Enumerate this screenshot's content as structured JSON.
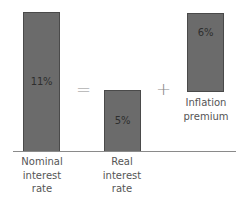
{
  "diagram": {
    "equation": {
      "equals_symbol": "=",
      "plus_symbol": "+"
    },
    "bars": [
      {
        "id": "nominal",
        "value_label": "11%",
        "value": 11,
        "label_lines": [
          "Nominal",
          "interest",
          "rate"
        ]
      },
      {
        "id": "real",
        "value_label": "5%",
        "value": 5,
        "label_lines": [
          "Real",
          "interest",
          "rate"
        ]
      },
      {
        "id": "inflation",
        "value_label": "6%",
        "value": 6,
        "label_lines": [
          "Inflation",
          "premium"
        ]
      }
    ],
    "colors": {
      "bar_fill": "#6b6b6b",
      "bar_border": "#4a4a4a",
      "value_text": "#2e2e2e",
      "label_text": "#555555",
      "operator": "#8a8a8a",
      "baseline": "#8a8a8a"
    }
  }
}
